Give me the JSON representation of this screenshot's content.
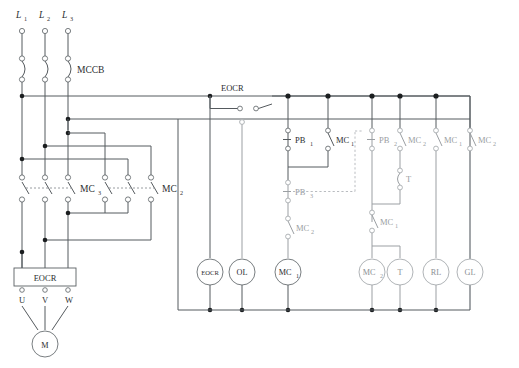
{
  "diagram": {
    "colors": {
      "wire": "#555a5e",
      "wire_light": "#9b9fa3",
      "node": "#1b1e20",
      "text": "#2b2e30",
      "faint_text": "#9a9ea2"
    }
  },
  "power_section": {
    "supply_labels": [
      "L",
      "L",
      "L"
    ],
    "supply_subscripts": [
      "1",
      "2",
      "3"
    ],
    "breaker_label": "MCCB",
    "contactor_main": {
      "label": "MC",
      "subscript": "3"
    },
    "contactor_secondary": {
      "label": "MC",
      "subscript": "2"
    },
    "relay_box_label": "EOCR",
    "motor_terminals": [
      "U",
      "V",
      "W"
    ],
    "motor_label": "M"
  },
  "control_section": {
    "eocr_contact_label": "EOCR",
    "contacts": [
      {
        "id": "pb1",
        "label": "PB",
        "subscript": "1",
        "type": "nc-pushbutton",
        "faint": false
      },
      {
        "id": "mc1-seal",
        "label": "MC",
        "subscript": "1",
        "type": "no-contact",
        "faint": false
      },
      {
        "id": "pb3",
        "label": "PB",
        "subscript": "3",
        "type": "nc-pushbutton",
        "faint": true
      },
      {
        "id": "mc2-interlock",
        "label": "MC",
        "subscript": "2",
        "type": "nc-contact",
        "faint": true
      },
      {
        "id": "pb2",
        "label": "PB",
        "subscript": "2",
        "type": "nc-pushbutton",
        "faint": true
      },
      {
        "id": "mc2-seal",
        "label": "MC",
        "subscript": "2",
        "type": "no-contact",
        "faint": true
      },
      {
        "id": "t-contact",
        "label": "T",
        "subscript": "",
        "type": "timer-contact",
        "faint": true
      },
      {
        "id": "mc1-interlock",
        "label": "MC",
        "subscript": "1",
        "type": "nc-contact",
        "faint": true
      },
      {
        "id": "mc1-lamp",
        "label": "MC",
        "subscript": "1",
        "type": "no-contact",
        "faint": true
      },
      {
        "id": "mc2-lamp",
        "label": "MC",
        "subscript": "2",
        "type": "nc-contact",
        "faint": true
      }
    ],
    "loads": [
      {
        "id": "eocr-coil",
        "label": "EOCR",
        "faint": false
      },
      {
        "id": "ol-lamp",
        "label": "OL",
        "faint": false
      },
      {
        "id": "mc1-coil",
        "label": "MC",
        "subscript": "1",
        "faint": false
      },
      {
        "id": "mc2-coil",
        "label": "MC",
        "subscript": "2",
        "faint": true
      },
      {
        "id": "timer-coil",
        "label": "T",
        "faint": true
      },
      {
        "id": "rl-lamp",
        "label": "RL",
        "faint": true
      },
      {
        "id": "gl-lamp",
        "label": "GL",
        "faint": true
      }
    ]
  }
}
